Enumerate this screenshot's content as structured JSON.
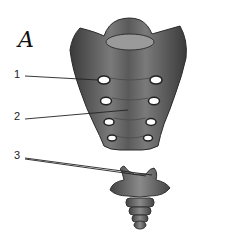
{
  "figure": {
    "panel_letter": "A",
    "labels": [
      {
        "number": "1",
        "x": 14,
        "y": 74
      },
      {
        "number": "2",
        "x": 14,
        "y": 115
      },
      {
        "number": "3",
        "x": 14,
        "y": 154
      }
    ],
    "colors": {
      "bone_dark": "#3f3f3f",
      "bone_mid": "#6e6e6e",
      "bone_light": "#a8a8a8",
      "line": "#222222"
    }
  }
}
